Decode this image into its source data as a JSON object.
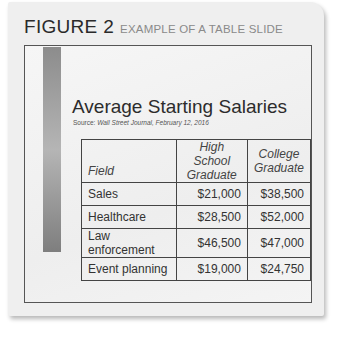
{
  "figure": {
    "number": "FIGURE 2",
    "caption": "EXAMPLE OF A TABLE SLIDE"
  },
  "slide": {
    "title": "Average Starting Salaries",
    "source_prefix": "Source: ",
    "source_italic": "Wall Street Journal, February 12, 2016",
    "table": {
      "headers": [
        {
          "line1": "Field",
          "line2": ""
        },
        {
          "line1": "High School",
          "line2": "Graduate"
        },
        {
          "line1": "College",
          "line2": "Graduate"
        }
      ],
      "rows": [
        {
          "field": "Sales",
          "high_school": "$21,000",
          "college": "$38,500"
        },
        {
          "field": "Healthcare",
          "high_school": "$28,500",
          "college": "$52,000"
        },
        {
          "field": "Law enforcement",
          "high_school": "$46,500",
          "college": "$47,000"
        },
        {
          "field": "Event planning",
          "high_school": "$19,000",
          "college": "$24,750"
        }
      ]
    }
  },
  "colors": {
    "card_bg": "#efefef",
    "slide_border": "#555555",
    "accent_bar": "#8c8c8c"
  }
}
